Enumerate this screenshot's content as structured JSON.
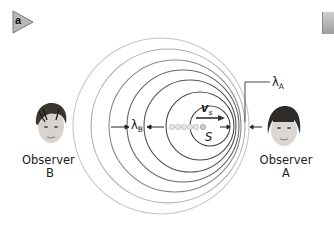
{
  "panel": {
    "badge_letter": "a",
    "badge_color": "#b8b8b8"
  },
  "labels": {
    "lambda_a_symbol": "λ",
    "lambda_a_sub": "A",
    "lambda_b_symbol": "λ",
    "lambda_b_sub": "B",
    "velocity_symbol": "v",
    "velocity_sub": "s",
    "source": "S"
  },
  "observers": [
    {
      "id": "B",
      "line1": "Observer",
      "line2": "B"
    },
    {
      "id": "A",
      "line1": "Observer",
      "line2": "A"
    }
  ],
  "waves": {
    "count": 7,
    "stroke_color": "#555555",
    "outer_stroke_color": "#bbbbbb",
    "circles": [
      {
        "cx": 210,
        "r": 20
      },
      {
        "cx": 200,
        "r": 34
      },
      {
        "cx": 189,
        "r": 47
      },
      {
        "cx": 183,
        "r": 55
      },
      {
        "cx": 175,
        "r": 65
      },
      {
        "cx": 168,
        "r": 77
      },
      {
        "cx": 161,
        "r": 88
      }
    ],
    "cy": 126,
    "source_dots": 6
  },
  "colors": {
    "line": "#333333",
    "wave_dark": "#555555",
    "wave_light": "#c4c4c4",
    "dots": "#cfcfcf"
  }
}
